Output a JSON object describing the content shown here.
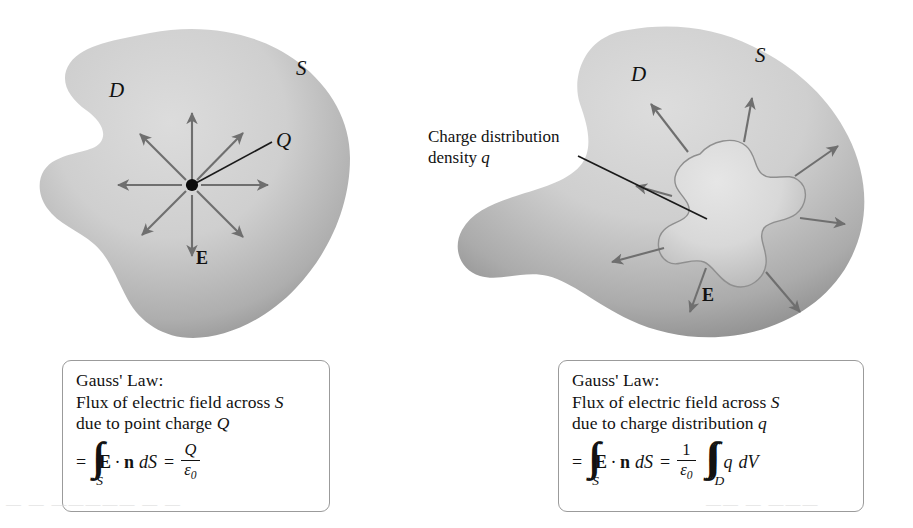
{
  "figure": {
    "background_color": "#ffffff",
    "ink_color": "#111111"
  },
  "palette": {
    "region_fill_light": "#d2d2d2",
    "region_fill_dark": "#949494",
    "inner_blob_light": "#d9d9d9",
    "inner_blob_dark": "#b0b0b0",
    "arrow_gray": "#6f6f6f",
    "leader_black": "#1a1a1a",
    "box_border": "#9b9b9b"
  },
  "left_panel": {
    "name": "point-charge-diagram",
    "labels": {
      "region": "D",
      "surface": "S",
      "charge": "Q",
      "field": "E"
    },
    "point_charge_marker": "filled-dot",
    "field_arrow_count": 8,
    "caption": {
      "line1": "Gauss' Law:",
      "line2_pre": "Flux of electric field across ",
      "line2_sym": "S",
      "line3_pre": "due to point charge ",
      "line3_sym": "Q",
      "equation": {
        "equals": "=",
        "integral_signs": "∫∫",
        "integral_subscript": "S",
        "integrand_vector_field": "E",
        "dot": "·",
        "integrand_normal": "n",
        "measure": "dS",
        "equals2": "=",
        "rhs_numerator": "Q",
        "rhs_denominator": "ε",
        "rhs_denominator_sub": "0"
      }
    }
  },
  "right_panel": {
    "name": "charge-distribution-diagram",
    "labels": {
      "region": "D",
      "surface": "S",
      "field": "E"
    },
    "annotation": {
      "line1": "Charge distribution",
      "line2_pre": "density ",
      "line2_sym": "q",
      "leader_line": "points-to-inner-blob"
    },
    "field_arrow_count": 8,
    "caption": {
      "line1": "Gauss' Law:",
      "line2_pre": "Flux of electric field across ",
      "line2_sym": "S",
      "line3_pre": "due to charge distribution ",
      "line3_sym": "q",
      "equation": {
        "equals": "=",
        "integral_signs": "∫∫",
        "integral_subscript": "S",
        "integrand_vector_field": "E",
        "dot": "·",
        "integrand_normal": "n",
        "measure": "dS",
        "equals2": "=",
        "prefactor_numerator": "1",
        "prefactor_denominator": "ε",
        "prefactor_denominator_sub": "0",
        "triple_integral_signs": "∫∫∫",
        "triple_integral_subscript": "D",
        "integrand_density": "q",
        "volume_measure": "dV"
      }
    }
  },
  "artifacts": {
    "bleed_left": "— —  ————— — —",
    "bleed_right": "——  — ———"
  }
}
